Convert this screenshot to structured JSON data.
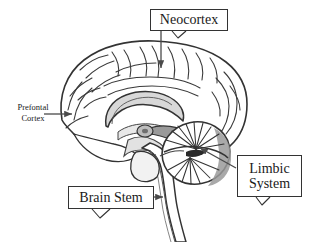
{
  "figure": {
    "type": "anatomical-diagram",
    "background_color": "#ffffff",
    "line_color": "#333333",
    "shade_color": "#999999",
    "light_shade_color": "#cccccc"
  },
  "labels": {
    "neocortex": {
      "text": "Neocortex",
      "boxed": true,
      "pointer": "arrow-down"
    },
    "prefontal_cortex": {
      "line1": "Prefontal",
      "line2": "Cortex",
      "boxed": false,
      "pointer": "arrow-right"
    },
    "limbic_system": {
      "line1": "Limbic",
      "line2": "System",
      "boxed": true,
      "pointer": "arrow-up-left"
    },
    "brain_stem": {
      "text": "Brain Stem",
      "boxed": true,
      "pointer": "arrow-right"
    }
  }
}
